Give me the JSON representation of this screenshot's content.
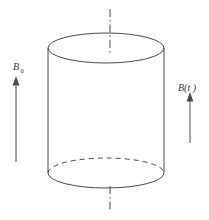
{
  "figure": {
    "labels": {
      "b0_symbol": "B",
      "b0_subscript": "0",
      "bt_symbol": "B(t )"
    },
    "colors": {
      "line": "#4a4a4a",
      "background": "#ffffff"
    }
  }
}
